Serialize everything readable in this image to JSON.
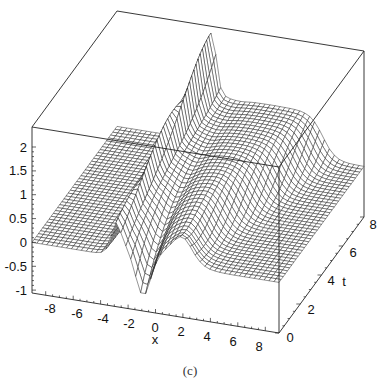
{
  "caption": "(c)",
  "chart_data": {
    "type": "surface3d",
    "title": "",
    "caption": "(c)",
    "xlabel": "x",
    "ylabel": "t",
    "zlabel": "",
    "xlim": [
      -9,
      9
    ],
    "ylim": [
      0,
      8
    ],
    "zlim": [
      -1.06,
      2.42
    ],
    "x_ticks": [
      "-8",
      "-6",
      "-4",
      "-2",
      "0",
      "2",
      "4",
      "6",
      "8"
    ],
    "t_ticks": [
      "0",
      "2",
      "4",
      "6",
      "8"
    ],
    "z_ticks": [
      "-1",
      "-0.5",
      "0",
      "0.5",
      "1",
      "1.5",
      "2"
    ],
    "grid": false,
    "box": true,
    "mesh": {
      "nx": 50,
      "nt": 40,
      "color": "#111111",
      "fill": "#ffffff"
    },
    "surface_description": "Wave surface u(x,t): flat 0 for x well left of front; a sharp peak ~2.2 at x≈-3 at t=8 (peak grows with t), a trough ~-1 at x≈-1, then a plateau near 1 to the right which moves rightwards with increasing t and drops back to ~0 at larger x.",
    "samples_t0": {
      "x": [
        -9,
        -4,
        -3,
        -1.5,
        -1,
        0,
        2,
        4,
        8
      ],
      "z": [
        0,
        0.1,
        0.5,
        -0.3,
        -1.0,
        -0.6,
        0.5,
        0.2,
        0
      ]
    },
    "samples_t8": {
      "x": [
        -9,
        -4,
        -3,
        -2,
        -1,
        0,
        2,
        5,
        7,
        9
      ],
      "z": [
        0,
        0.2,
        2.2,
        1.4,
        1.0,
        1.0,
        1.0,
        1.0,
        0.3,
        0.1
      ]
    }
  },
  "axes": {
    "z_ticks": [
      {
        "label": "2",
        "x": 27,
        "y": 147
      },
      {
        "label": "1.5",
        "x": 27,
        "y": 170
      },
      {
        "label": "1",
        "x": 27,
        "y": 194
      },
      {
        "label": "0.5",
        "x": 27,
        "y": 218
      },
      {
        "label": "0",
        "x": 27,
        "y": 242
      },
      {
        "label": "-0.5",
        "x": 27,
        "y": 266
      },
      {
        "label": "-1",
        "x": 27,
        "y": 290
      }
    ],
    "x_ticks": [
      {
        "label": "-8",
        "x": 50,
        "y": 302
      },
      {
        "label": "-6",
        "x": 77,
        "y": 307
      },
      {
        "label": "-4",
        "x": 103,
        "y": 312
      },
      {
        "label": "-2",
        "x": 129,
        "y": 317
      },
      {
        "label": "0",
        "x": 155,
        "y": 321
      },
      {
        "label": "2",
        "x": 181,
        "y": 325
      },
      {
        "label": "4",
        "x": 207,
        "y": 330
      },
      {
        "label": "6",
        "x": 233,
        "y": 335
      },
      {
        "label": "8",
        "x": 259,
        "y": 340
      }
    ],
    "x_label": {
      "label": "x",
      "x": 155,
      "y": 333
    },
    "t_ticks": [
      {
        "label": "0",
        "x": 290,
        "y": 331
      },
      {
        "label": "2",
        "x": 311,
        "y": 303
      },
      {
        "label": "4",
        "x": 331,
        "y": 274
      },
      {
        "label": "6",
        "x": 353,
        "y": 246
      },
      {
        "label": "8",
        "x": 373,
        "y": 218
      }
    ],
    "t_label": {
      "label": "t",
      "x": 344,
      "y": 275
    }
  }
}
